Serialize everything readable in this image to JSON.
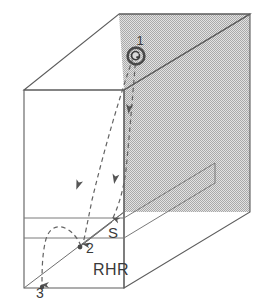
{
  "figure": {
    "title": "",
    "type": "3d-block-diagram",
    "labels": {
      "point1": "1",
      "point2": "2",
      "point3": "3",
      "surface": "S",
      "rule": "RHR"
    },
    "colors": {
      "background": "#ffffff",
      "line": "#5a5a5a",
      "shaded_face": "#c8c8c8",
      "text": "#3a3a3a",
      "dashed": "#6a6a6a"
    },
    "icons": {
      "point1_marker": "spiral-source-icon",
      "arrow_marker": "arrowhead-icon"
    },
    "annotations": [
      {
        "name": "source-point",
        "label": "1",
        "x": 143,
        "y": 40
      },
      {
        "name": "intermediate-point",
        "label": "2",
        "x": 86,
        "y": 247
      },
      {
        "name": "end-point",
        "label": "3",
        "x": 41,
        "y": 291
      },
      {
        "name": "surface-label",
        "label": "S",
        "x": 113,
        "y": 234
      },
      {
        "name": "rule-label",
        "label": "RHR",
        "x": 111,
        "y": 270
      }
    ],
    "geometry": {
      "front_top_left": [
        24,
        90
      ],
      "front_bottom_left": [
        24,
        288
      ],
      "front_top_right": [
        124,
        90
      ],
      "front_bottom_right": [
        124,
        288
      ],
      "back_top_left": [
        119,
        14
      ],
      "back_top_right": [
        250,
        14
      ],
      "back_bottom_right": [
        250,
        212
      ],
      "shaded_face_note": "right and back faces rendered with halftone gray"
    }
  }
}
